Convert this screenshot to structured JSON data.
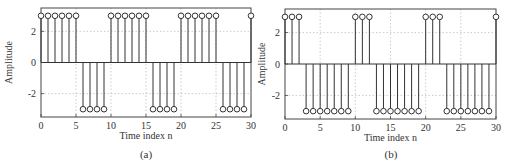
{
  "chart_data": [
    {
      "type": "stem",
      "panel_label": "(a)",
      "title": "",
      "xlabel": "Time index n",
      "ylabel": "Amplitude",
      "xlim": [
        0,
        30
      ],
      "ylim": [
        -3.5,
        3.5
      ],
      "xticks": [
        0,
        5,
        10,
        15,
        20,
        25,
        30
      ],
      "yticks": [
        -2,
        0,
        2
      ],
      "grid": true,
      "marker": "o",
      "x": [
        0,
        1,
        2,
        3,
        4,
        5,
        6,
        7,
        8,
        9,
        10,
        11,
        12,
        13,
        14,
        15,
        16,
        17,
        18,
        19,
        20,
        21,
        22,
        23,
        24,
        25,
        26,
        27,
        28,
        29,
        30
      ],
      "values": [
        3,
        3,
        3,
        3,
        3,
        3,
        -3,
        -3,
        -3,
        -3,
        3,
        3,
        3,
        3,
        3,
        3,
        -3,
        -3,
        -3,
        -3,
        3,
        3,
        3,
        3,
        3,
        3,
        -3,
        -3,
        -3,
        -3,
        3
      ]
    },
    {
      "type": "stem",
      "panel_label": "(b)",
      "title": "",
      "xlabel": "Time index n",
      "ylabel": "Amplitude",
      "xlim": [
        0,
        30
      ],
      "ylim": [
        -3.5,
        3.5
      ],
      "xticks": [
        0,
        5,
        10,
        15,
        20,
        25,
        30
      ],
      "yticks": [
        -2,
        0,
        2
      ],
      "grid": true,
      "marker": "o",
      "x": [
        0,
        1,
        2,
        3,
        4,
        5,
        6,
        7,
        8,
        9,
        10,
        11,
        12,
        13,
        14,
        15,
        16,
        17,
        18,
        19,
        20,
        21,
        22,
        23,
        24,
        25,
        26,
        27,
        28,
        29,
        30
      ],
      "values": [
        3,
        3,
        3,
        -3,
        -3,
        -3,
        -3,
        -3,
        -3,
        -3,
        3,
        3,
        3,
        -3,
        -3,
        -3,
        -3,
        -3,
        -3,
        -3,
        3,
        3,
        3,
        -3,
        -3,
        -3,
        -3,
        -3,
        -3,
        -3,
        3
      ]
    }
  ]
}
